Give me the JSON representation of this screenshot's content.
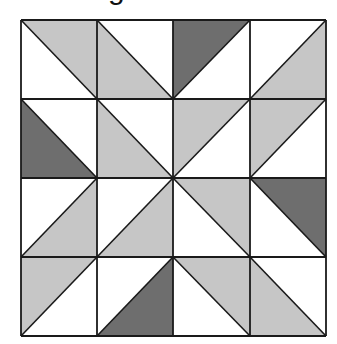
{
  "caption": {
    "visible_fragment": "g"
  },
  "colors": {
    "white": "#ffffff",
    "light": "#c6c6c6",
    "dark": "#6e6e6e",
    "line": "#1a1a1a"
  },
  "grid": {
    "rows": 4,
    "cols": 4,
    "x_lines": [
      21,
      97,
      173,
      250,
      326
    ],
    "y_lines": [
      20,
      99,
      178,
      257,
      336
    ],
    "cells": [
      [
        {
          "diagonal": "tl-br",
          "shaded_half": "top-right",
          "shade": "light"
        },
        {
          "diagonal": "tl-br",
          "shaded_half": "bottom-left",
          "shade": "light"
        },
        {
          "diagonal": "tr-bl",
          "shaded_half": "top-left",
          "shade": "dark"
        },
        {
          "diagonal": "tr-bl",
          "shaded_half": "bottom-right",
          "shade": "light"
        }
      ],
      [
        {
          "diagonal": "tl-br",
          "shaded_half": "bottom-left",
          "shade": "dark"
        },
        {
          "diagonal": "tl-br",
          "shaded_half": "bottom-left",
          "shade": "light"
        },
        {
          "diagonal": "tr-bl",
          "shaded_half": "top-left",
          "shade": "light"
        },
        {
          "diagonal": "tr-bl",
          "shaded_half": "top-left",
          "shade": "light"
        }
      ],
      [
        {
          "diagonal": "tr-bl",
          "shaded_half": "bottom-right",
          "shade": "light"
        },
        {
          "diagonal": "tr-bl",
          "shaded_half": "bottom-right",
          "shade": "light"
        },
        {
          "diagonal": "tl-br",
          "shaded_half": "top-right",
          "shade": "light"
        },
        {
          "diagonal": "tl-br",
          "shaded_half": "top-right",
          "shade": "dark"
        }
      ],
      [
        {
          "diagonal": "tr-bl",
          "shaded_half": "top-left",
          "shade": "light"
        },
        {
          "diagonal": "tr-bl",
          "shaded_half": "bottom-right",
          "shade": "dark"
        },
        {
          "diagonal": "tl-br",
          "shaded_half": "top-right",
          "shade": "light"
        },
        {
          "diagonal": "tl-br",
          "shaded_half": "bottom-left",
          "shade": "light"
        }
      ]
    ]
  }
}
